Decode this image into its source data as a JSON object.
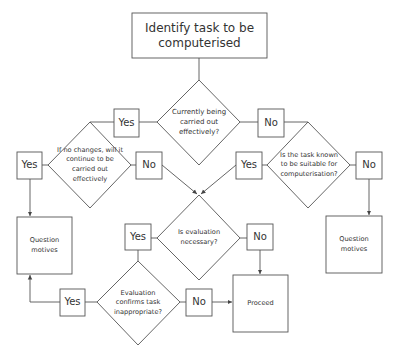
{
  "flowchart": {
    "start": {
      "text": "Identify task to be computerised"
    },
    "decisions": {
      "currently_effective": {
        "text": "Currently being carried out effectively?",
        "yes": "Yes",
        "no": "No"
      },
      "continue_effective": {
        "text": "If no changes, will it continue to be carried out effectively",
        "yes": "Yes",
        "no": "No"
      },
      "known_suitable": {
        "text": "Is the task known to be suitable for computerisation?",
        "yes": "Yes",
        "no": "No"
      },
      "evaluation_necessary": {
        "text": "Is evaluation necessary?",
        "yes": "Yes",
        "no": "No"
      },
      "evaluation_confirms": {
        "text": "Evaluation confirms task inappropriate?",
        "yes": "Yes",
        "no": "No"
      }
    },
    "outcomes": {
      "question_motives_left": "Question motives",
      "question_motives_right": "Question motives",
      "proceed": "Proceed"
    },
    "colors": {
      "stroke": "#555555",
      "text": "#333333",
      "background": "#ffffff"
    }
  }
}
